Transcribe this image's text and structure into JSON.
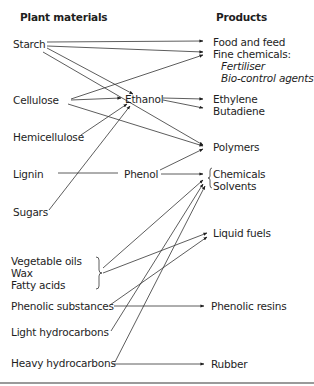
{
  "headers": {
    "plant_materials": "Plant materials",
    "products": "Products"
  },
  "sources": {
    "starch": "Starch",
    "cellulose": "Cellulose",
    "hemicellulose": "Hemicellulose",
    "lignin": "Lignin",
    "sugars": "Sugars",
    "vegetable_oils": "Vegetable oils",
    "wax": "Wax",
    "fatty_acids": "Fatty acids",
    "phenolic_substances": "Phenolic substances",
    "light_hydrocarbons": "Light hydrocarbons",
    "heavy_hydrocarbons": "Heavy hydrocarbons"
  },
  "intermediates": {
    "ethanol": "Ethanol",
    "phenol": "Phenol"
  },
  "products": {
    "food_and_feed": "Food and feed",
    "fine_chemicals": "Fine chemicals:",
    "fertiliser": "Fertiliser",
    "bio_control_agents": "Bio-control agents",
    "ethylene": "Ethylene",
    "butadiene": "Butadiene",
    "polymers": "Polymers",
    "chemicals": "Chemicals",
    "solvents": "Solvents",
    "liquid_fuels": "Liquid fuels",
    "phenolic_resins": "Phenolic resins",
    "rubber": "Rubber"
  },
  "links": [
    [
      "Starch",
      "Food and feed"
    ],
    [
      "Starch",
      "Fine chemicals"
    ],
    [
      "Starch",
      "Ethanol"
    ],
    [
      "Starch",
      "Polymers"
    ],
    [
      "Cellulose",
      "Fine chemicals"
    ],
    [
      "Cellulose",
      "Ethanol"
    ],
    [
      "Cellulose",
      "Polymers"
    ],
    [
      "Hemicellulose",
      "Ethanol"
    ],
    [
      "Sugars",
      "Ethanol"
    ],
    [
      "Ethanol",
      "Ethylene"
    ],
    [
      "Ethanol",
      "Butadiene"
    ],
    [
      "Lignin",
      "Phenol"
    ],
    [
      "Phenol",
      "Polymers"
    ],
    [
      "Phenol",
      "Chemicals/Solvents"
    ],
    [
      "Vegetable oils/Wax/Fatty acids",
      "Chemicals/Solvents"
    ],
    [
      "Vegetable oils/Wax/Fatty acids",
      "Liquid fuels"
    ],
    [
      "Phenolic substances",
      "Liquid fuels"
    ],
    [
      "Phenolic substances",
      "Phenolic resins"
    ],
    [
      "Light hydrocarbons",
      "Chemicals/Solvents"
    ],
    [
      "Heavy hydrocarbons",
      "Chemicals/Solvents"
    ],
    [
      "Heavy hydrocarbons",
      "Rubber"
    ]
  ]
}
